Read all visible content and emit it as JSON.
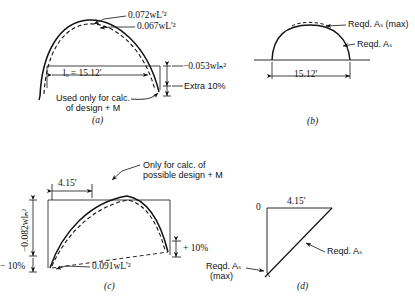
{
  "figure": {
    "panels": [
      {
        "id": "(a)",
        "name": "moment-diagram-positive",
        "labels": {
          "moment_solid": "0.072wL'²",
          "moment_dashed": "0.067wL'²",
          "span": "lₒ = 15.12'",
          "negative_moment": "−0.053wlₙ²",
          "extra": "Extra 10%",
          "note_line1": "Used only for calc.",
          "note_line2": "of design + M"
        }
      },
      {
        "id": "(b)",
        "name": "required-steel-positive",
        "labels": {
          "reqd_as_max": "Reqd. Aₛ (max)",
          "reqd_as": "Reqd. Aₛ",
          "span": "15.12'"
        }
      },
      {
        "id": "(c)",
        "name": "moment-diagram-negative",
        "labels": {
          "distance": "4.15'",
          "negative_moment": "−0.082wlₙ²",
          "minus_ten": "− 10%",
          "plus_ten": "+ 10%",
          "positive_moment": "0.091wL'²",
          "note_line1": "Only for calc. of",
          "note_line2": "possible design + M"
        }
      },
      {
        "id": "(d)",
        "name": "required-steel-negative",
        "labels": {
          "zero": "0",
          "distance": "4.15'",
          "reqd_as": "Reqd. Aₛ",
          "reqd_as_max_line1": "Reqd. Aₛ",
          "reqd_as_max_line2": "(max)"
        }
      }
    ],
    "colors": {
      "ink": "#121212",
      "background": "#ffffff"
    }
  }
}
